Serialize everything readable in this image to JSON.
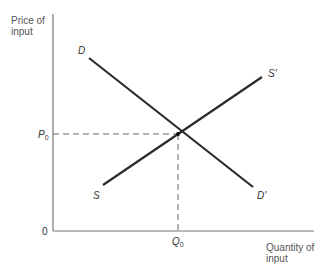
{
  "diagram": {
    "type": "supply-demand",
    "y_axis_label_line1": "Price of",
    "y_axis_label_line2": "input",
    "x_axis_label_line1": "Quantity of",
    "x_axis_label_line2": "input",
    "origin_label": "0",
    "equilibrium_price_label": "P",
    "equilibrium_price_sub": "0",
    "equilibrium_quantity_label": "Q",
    "equilibrium_quantity_sub": "0",
    "demand_start_label": "D",
    "demand_end_label": "D'",
    "supply_start_label": "S",
    "supply_end_label": "S'",
    "colors": {
      "axis": "#777777",
      "curve": "#2b2b2b",
      "dashed": "#666666",
      "text": "#555555"
    }
  }
}
